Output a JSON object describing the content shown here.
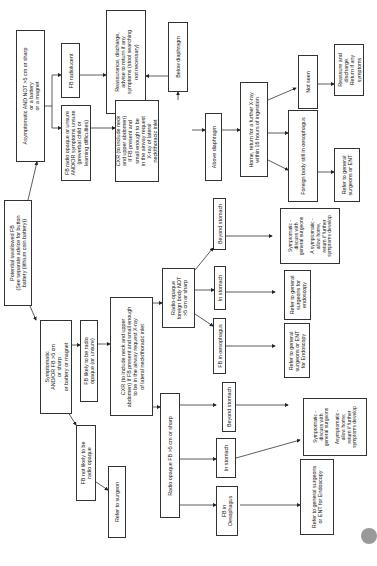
{
  "flowchart": {
    "start": {
      "text": "Potential swallowed FB\n(See separate advice for button\nbattery (lithium coin battery))"
    },
    "asymptomatic": {
      "text": "Asymptomatic AND NOT >5 cm or sharp\nor a battery\nor a magnet"
    },
    "fb_radiolucent": {
      "text": "FB radiolucent"
    },
    "reassurance_1": {
      "text": "Reassurance, discharge,\nadvise to return if any\nsymptoms (stool searching\nnot necessary)"
    },
    "fb_radio_opaque_unsure": {
      "text": "FB radio opaque or unsure\nAND/OR symptoms unsure\n(preverbal child or\nlearning difficulties)"
    },
    "cxr_top": {
      "text": "CXR (to include neck\nand upper abdomen)\nIf FB present and\nsmall enough to be\nin the airway request\nX-ray of lateral\nneck/thoracic inlet"
    },
    "below_diaphragm": {
      "text": "Below diaphragm"
    },
    "above_diaphragm": {
      "text": "Above diaphragm"
    },
    "home_return": {
      "text": "Home, return for a further X-ray\nwithin 16 hours of ingestion"
    },
    "not_seen": {
      "text": "Not seen"
    },
    "reassure_discharge": {
      "text": "Reassure and\ndischarge.\nReturn if any\nsymptoms"
    },
    "fb_still_oesophagus": {
      "text": "Foreign body still in oesophagus"
    },
    "refer_gs_ent_top": {
      "text": "Refer to general\nsurgeons or ENT"
    },
    "symptomatic": {
      "text": "Symptomatic\nAND/OR FB >5 cm\nor sharp\nor battery or magnet"
    },
    "fb_likely_opaque": {
      "text": "FB likely to be radio\nopaque (or unsure)"
    },
    "fb_not_likely_opaque": {
      "text": "FB not likely to be\nradio opaque"
    },
    "refer_surgeon": {
      "text": "Refer to surgeon"
    },
    "cxr_mid": {
      "text": "CXR (to include neck and upper\nabdomen) If FB present and small enough\nto be in the airway request X-ray\nof lateral neck/thoracic inlet"
    },
    "radio_opaque_not5": {
      "text": "Radio-opaque\nforeign body NOT\n>5 cm or sharp"
    },
    "fb_in_oesophagus_mid": {
      "text": "FB in oesophagus"
    },
    "in_stomach_mid": {
      "text": "In stomach"
    },
    "beyond_stomach_mid": {
      "text": "Beyond stomach"
    },
    "refer_gs_ent_endo_mid": {
      "text": "Refer to general\nsurgeons or ENT\nfor Endoscopy"
    },
    "refer_gs_endo_mid": {
      "text": "Refer to general\nsurgeons for\nendoscopy"
    },
    "symptomatic_discuss_mid": {
      "text": "Symptomatic -\ndiscuss with\ngeneral surgeons\n\nA symptomatic -\nallow home,\nreturn if further\nsymptoms develop"
    },
    "radio_opaque_5": {
      "text": "Radio opaque FB >5 cm or sharp"
    },
    "fb_in_oesophagus_bot": {
      "text": "FB in\nOesophagus"
    },
    "in_stomach_bot": {
      "text": "In stomach"
    },
    "beyond_stomach_bot": {
      "text": "Beyond stomach"
    },
    "refer_gs_ent_endo_bot": {
      "text": "Refer to general surgeons\nor ENT for Endoscopy"
    },
    "symptomatic_discuss_bot": {
      "text": "Symptomatic -\ndiscuss with\ngeneral surgeons\n\nAsymptomatic -\nallow home;\nreturn if further\nsymptoms develop"
    }
  },
  "colors": {
    "line": "#333333",
    "background": "#ffffff"
  }
}
